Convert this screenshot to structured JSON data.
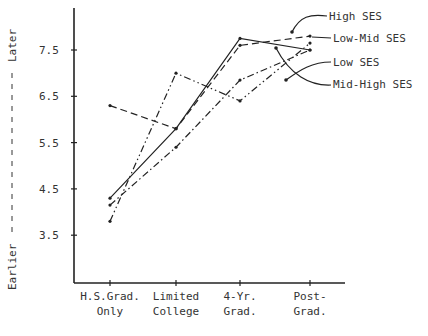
{
  "chart_data": {
    "type": "line",
    "title": "",
    "xlabel": "",
    "ylabel": "Earlier - - - - - - - - Later",
    "ylabel_low": "Earlier",
    "ylabel_high": "Later",
    "categories": [
      "H.S.Grad. Only",
      "Limited College",
      "4-Yr. Grad.",
      "Post-Grad."
    ],
    "category_lines": [
      [
        "H.S.Grad.",
        "Only"
      ],
      [
        "Limited",
        "College"
      ],
      [
        "4-Yr.",
        "Grad."
      ],
      [
        "Post-",
        "Grad."
      ]
    ],
    "yticks": [
      "3.5",
      "4.5",
      "5.5",
      "6.5",
      "7.5"
    ],
    "ylim": [
      2.7,
      8.2
    ],
    "grid": false,
    "legend_position": "annotated-right",
    "series": [
      {
        "name": "High SES",
        "style": "solid",
        "values": [
          4.3,
          5.8,
          7.75,
          7.5
        ]
      },
      {
        "name": "Low-Mid SES",
        "style": "dashed",
        "values": [
          6.3,
          5.8,
          7.6,
          7.8
        ]
      },
      {
        "name": "Low SES",
        "style": "dashdot",
        "values": [
          4.15,
          5.4,
          6.85,
          7.5
        ]
      },
      {
        "name": "Mid-High SES",
        "style": "dashdotdot",
        "values": [
          3.8,
          7.0,
          6.4,
          7.65
        ]
      }
    ]
  }
}
